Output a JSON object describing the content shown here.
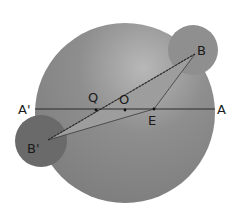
{
  "diagram": {
    "type": "geometry",
    "colors": {
      "background": "#ffffff",
      "big_circle": "#8c8c8c",
      "big_circle_highlight": "#b4b4b4",
      "circle_B": "#8f8f8f",
      "circle_B_prime": "#6a6a6a",
      "triangle_fill": "#9a9a9a",
      "lines": "#2b2b2b"
    },
    "labels": {
      "A": "A",
      "A_prime": "A'",
      "B": "B",
      "B_prime": "B'",
      "O": "O",
      "Q": "Q",
      "E": "E"
    },
    "points": {
      "O": [
        125,
        110
      ],
      "Q": [
        96,
        110
      ],
      "E": [
        154,
        109
      ],
      "B": [
        195,
        54
      ],
      "B_prime": [
        48,
        140
      ],
      "A": [
        215,
        109
      ],
      "A_prime": [
        35,
        109
      ]
    },
    "circles": {
      "big": {
        "cx": 125,
        "cy": 113,
        "r": 90
      },
      "B": {
        "cx": 193,
        "cy": 50,
        "r": 25
      },
      "B_prime": {
        "cx": 41,
        "cy": 141,
        "r": 26
      }
    }
  }
}
